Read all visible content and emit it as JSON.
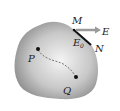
{
  "diagram": {
    "labels": {
      "M": "M",
      "N": "N",
      "E": "E",
      "E0_main": "E",
      "E0_sub": "0",
      "P": "P",
      "Q": "Q"
    },
    "colors": {
      "body_edge": "#8a8a8a",
      "body_center": "#f2f2f2",
      "arrow": "#9a9a9a",
      "surface_segment": "#111111",
      "point": "#111111",
      "path": "#555555",
      "text": "#222222"
    }
  }
}
